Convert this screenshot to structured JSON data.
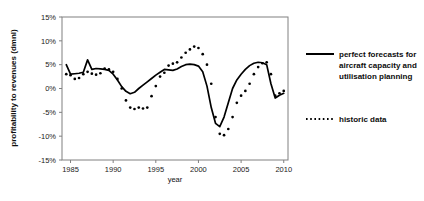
{
  "chart_data": {
    "type": "line",
    "title": "",
    "xlabel": "year",
    "ylabel": "profitability to revenues (dmnl)",
    "xlim": [
      1984,
      2010.5
    ],
    "ylim": [
      -0.15,
      0.15
    ],
    "grid": false,
    "legend_position": "right",
    "x_ticks": [
      "1985",
      "1990",
      "1995",
      "2000",
      "2005",
      "2010"
    ],
    "x_tick_values": [
      1985,
      1990,
      1995,
      2000,
      2005,
      2010
    ],
    "y_ticks": [
      "15%",
      "10%",
      "5%",
      "0%",
      "-5%",
      "-10%",
      "-15%"
    ],
    "y_tick_values": [
      0.15,
      0.1,
      0.05,
      0.0,
      -0.05,
      -0.1,
      -0.15
    ],
    "x": [
      1984.5,
      1985,
      1985.5,
      1986,
      1986.5,
      1987,
      1987.5,
      1988,
      1988.5,
      1989,
      1989.5,
      1990,
      1990.5,
      1991,
      1991.5,
      1992,
      1992.5,
      1993,
      1993.5,
      1994,
      1994.5,
      1995,
      1995.5,
      1996,
      1996.5,
      1997,
      1997.5,
      1998,
      1998.5,
      1999,
      1999.5,
      2000,
      2000.5,
      2001,
      2001.5,
      2002,
      2002.5,
      2003,
      2003.5,
      2004,
      2004.5,
      2005,
      2005.5,
      2006,
      2006.5,
      2007,
      2007.5,
      2008,
      2008.5,
      2009,
      2009.5,
      2010
    ],
    "series": [
      {
        "name": "perfect forecasts for aircraft capacity and utilisation planning",
        "style": "solid",
        "color": "#000000",
        "values": [
          0.05,
          0.03,
          0.031,
          0.032,
          0.034,
          0.06,
          0.04,
          0.042,
          0.041,
          0.04,
          0.038,
          0.03,
          0.018,
          0.004,
          -0.006,
          -0.011,
          -0.008,
          0.0,
          0.007,
          0.014,
          0.021,
          0.028,
          0.034,
          0.04,
          0.039,
          0.038,
          0.041,
          0.046,
          0.05,
          0.051,
          0.05,
          0.047,
          0.035,
          0.005,
          -0.04,
          -0.073,
          -0.08,
          -0.06,
          -0.03,
          0.0,
          0.018,
          0.03,
          0.04,
          0.048,
          0.053,
          0.055,
          0.054,
          0.05,
          0.01,
          -0.02,
          -0.014,
          -0.01
        ]
      },
      {
        "name": "historic data",
        "style": "dotted",
        "color": "#000000",
        "values": [
          0.03,
          0.028,
          0.02,
          0.022,
          0.03,
          0.035,
          0.031,
          0.029,
          0.032,
          0.042,
          0.04,
          0.035,
          0.02,
          0.0,
          -0.025,
          -0.04,
          -0.043,
          -0.04,
          -0.042,
          -0.04,
          -0.016,
          0.005,
          0.025,
          0.033,
          0.048,
          0.052,
          0.055,
          0.065,
          0.075,
          0.082,
          0.088,
          0.085,
          0.072,
          0.05,
          0.01,
          -0.06,
          -0.095,
          -0.098,
          -0.085,
          -0.06,
          -0.03,
          -0.015,
          -0.005,
          0.01,
          0.03,
          0.045,
          0.053,
          0.055,
          0.03,
          -0.015,
          -0.01,
          -0.005
        ]
      }
    ],
    "legend": [
      {
        "label_lines": [
          "perfect forecasts for",
          "aircraft capacity and",
          "utilisation planning"
        ],
        "style": "solid"
      },
      {
        "label_lines": [
          "historic data"
        ],
        "style": "dotted"
      }
    ]
  }
}
